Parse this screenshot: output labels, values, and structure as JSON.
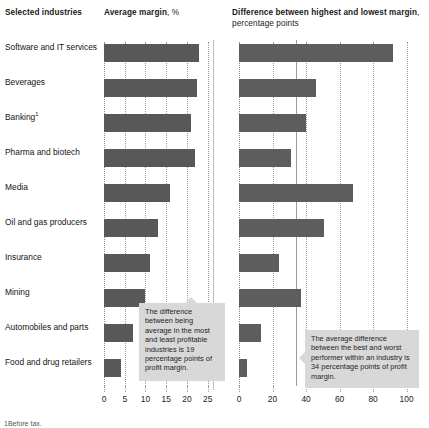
{
  "header": {
    "industries_label": "Selected industries",
    "avg_title_bold": "Average margin",
    "avg_title_light": ", %",
    "diff_title_bold": "Difference between highest and lowest margin",
    "diff_title_light": ", percentage points"
  },
  "footnote": "1Before tax.",
  "annotations": {
    "left": "The difference between being average in the most and least profitable industries is 19 percentage points of profit margin.",
    "right": "The average difference between the best and worst performer within an industry is 34 percentage points of profit margin."
  },
  "chart_data": {
    "type": "bar",
    "categories": [
      "Software and IT services",
      "Beverages",
      "Banking¹",
      "Pharma and biotech",
      "Media",
      "Oil and gas producers",
      "Insurance",
      "Mining",
      "Automobiles and parts",
      "Food and drug retailers"
    ],
    "series": [
      {
        "name": "Average margin, %",
        "panel": "left",
        "values": [
          23,
          22.5,
          21,
          22,
          16,
          13,
          11,
          10,
          7,
          4
        ],
        "xlabel": "",
        "ylabel": "",
        "xlim": [
          0,
          27
        ],
        "ticks": [
          0,
          5,
          10,
          15,
          20,
          25
        ],
        "tick_labels": [
          "0",
          "5",
          "10",
          "15",
          "20",
          "25"
        ]
      },
      {
        "name": "Difference between highest and lowest margin, percentage points",
        "panel": "right",
        "values": [
          92,
          46,
          40,
          31,
          68,
          51,
          24,
          37,
          13,
          5
        ],
        "xlabel": "",
        "ylabel": "",
        "xlim": [
          0,
          105
        ],
        "ticks": [
          0,
          20,
          40,
          60,
          80,
          100
        ],
        "tick_labels": [
          "0",
          "20",
          "40",
          "60",
          "80",
          "100"
        ],
        "reference_line": {
          "value": 34,
          "label": "average difference"
        }
      }
    ],
    "grid": true,
    "legend": "none",
    "bar_color": "#585858",
    "annotation_bg": "#d8d8d8"
  }
}
